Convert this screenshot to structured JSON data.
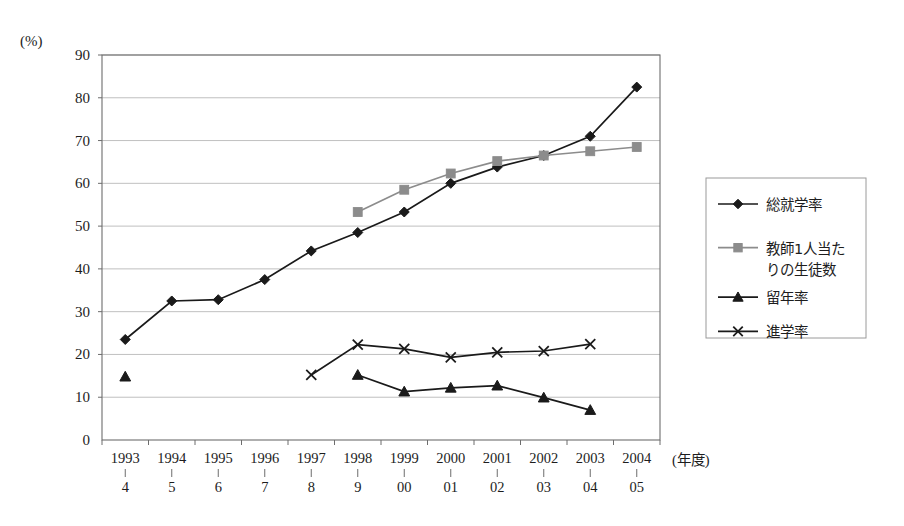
{
  "chart_data": {
    "type": "line",
    "title": "",
    "xlabel": "(年度)",
    "ylabel": "(%)",
    "ylim": [
      0,
      90
    ],
    "y_ticks": [
      0,
      10,
      20,
      30,
      40,
      50,
      60,
      70,
      80,
      90
    ],
    "grid": true,
    "legend_position": "right",
    "categories": [
      "1993\n4",
      "1994\n5",
      "1995\n6",
      "1996\n7",
      "1997\n8",
      "1998\n9",
      "1999\n00",
      "2000\n01",
      "2001\n02",
      "2002\n03",
      "2003\n04",
      "2004\n05"
    ],
    "category_top": [
      "1993",
      "1994",
      "1995",
      "1996",
      "1997",
      "1998",
      "1999",
      "2000",
      "2001",
      "2002",
      "2003",
      "2004"
    ],
    "category_bottom": [
      "4",
      "5",
      "6",
      "7",
      "8",
      "9",
      "00",
      "01",
      "02",
      "03",
      "04",
      "05"
    ],
    "series": [
      {
        "name": "総就学率",
        "marker": "diamond",
        "color": "#1a1a1a",
        "values": [
          23.5,
          32.5,
          32.8,
          37.5,
          44.2,
          48.5,
          53.3,
          60.0,
          63.8,
          66.5,
          71.0,
          82.5
        ]
      },
      {
        "name": "教師1人当たりの生徒数",
        "marker": "square",
        "color": "#8c8c8c",
        "values": [
          null,
          null,
          null,
          null,
          null,
          53.3,
          58.5,
          62.3,
          65.2,
          66.5,
          67.5,
          68.5
        ]
      },
      {
        "name": "留年率",
        "marker": "triangle",
        "color": "#1a1a1a",
        "values": [
          14.8,
          null,
          null,
          null,
          null,
          15.2,
          11.3,
          12.2,
          12.7,
          9.9,
          7.0,
          null
        ]
      },
      {
        "name": "進学率",
        "marker": "cross",
        "color": "#1a1a1a",
        "values": [
          null,
          null,
          null,
          null,
          15.2,
          22.3,
          21.3,
          19.3,
          20.5,
          20.8,
          22.4,
          null
        ]
      }
    ]
  },
  "legend": {
    "items": [
      {
        "label": "総就学率"
      },
      {
        "label": "教師1人当た"
      },
      {
        "label": "りの生徒数"
      },
      {
        "label": "留年率"
      },
      {
        "label": "進学率"
      }
    ]
  }
}
